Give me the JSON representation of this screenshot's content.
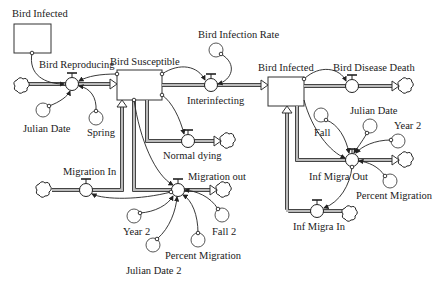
{
  "diagram": {
    "type": "stock-and-flow",
    "stocks": [
      {
        "id": "bird-infected-ghost",
        "label": "Bird Infected"
      },
      {
        "id": "bird-susceptible",
        "label": "Bird Susceptible"
      },
      {
        "id": "bird-infected",
        "label": "Bird Infected"
      }
    ],
    "flows": [
      {
        "id": "bird-reproducing",
        "label": "Bird Reproducing"
      },
      {
        "id": "interinfecting",
        "label": "Interinfecting"
      },
      {
        "id": "bird-disease-death",
        "label": "Bird Disease Death"
      },
      {
        "id": "normal-dying",
        "label": "Normal dying"
      },
      {
        "id": "migration-in",
        "label": "Migration In"
      },
      {
        "id": "migration-out",
        "label": "Migration out"
      },
      {
        "id": "inf-migra-out",
        "label": "Inf Migra Out"
      },
      {
        "id": "inf-migra-in",
        "label": "Inf Migra In"
      }
    ],
    "auxiliaries": [
      {
        "id": "julian-date",
        "label": "Julian Date"
      },
      {
        "id": "spring",
        "label": "Spring"
      },
      {
        "id": "bird-infection-rate",
        "label": "Bird Infection Rate"
      },
      {
        "id": "julian-date-right",
        "label": "Julian Date"
      },
      {
        "id": "fall",
        "label": "Fall"
      },
      {
        "id": "year-2-right",
        "label": "Year 2"
      },
      {
        "id": "percent-migration-right",
        "label": "Percent Migration"
      },
      {
        "id": "year-2",
        "label": "Year 2"
      },
      {
        "id": "julian-date-2",
        "label": "Julian Date 2"
      },
      {
        "id": "percent-migration",
        "label": "Percent Migration"
      },
      {
        "id": "fall-2",
        "label": "Fall 2"
      }
    ]
  }
}
